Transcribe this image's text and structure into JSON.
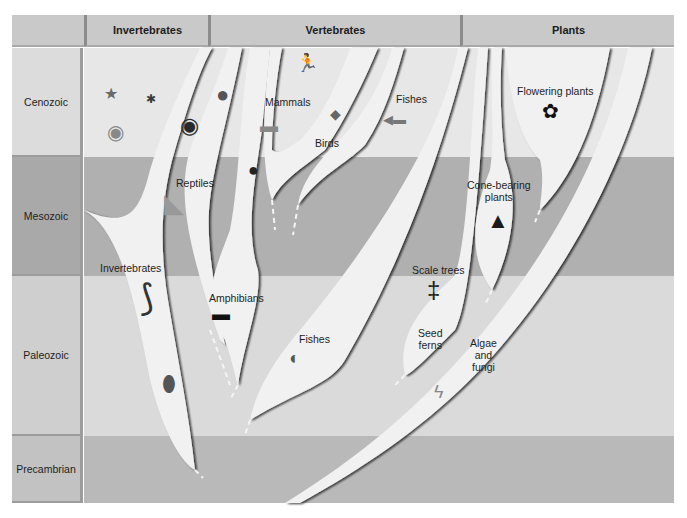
{
  "header": {
    "corner": "",
    "groups": [
      {
        "label": "Invertebrates"
      },
      {
        "label": "Vertebrates"
      },
      {
        "label": "Plants"
      }
    ]
  },
  "eras": [
    {
      "label": "Cenozoic",
      "color": "#e7e7e7",
      "label_color": "#dcdcdc"
    },
    {
      "label": "Mesozoic",
      "color": "#b0b0b0",
      "label_color": "#a9a9a9"
    },
    {
      "label": "Paleozoic",
      "color": "#dadada",
      "label_color": "#cfcfcf"
    },
    {
      "label": "Precambrian",
      "color": "#b9b9b9",
      "label_color": "#c2c2c2"
    }
  ],
  "lineages": {
    "invertebrates": "Invertebrates",
    "reptiles": "Reptiles",
    "amphibians": "Amphibians",
    "mammals": "Mammals",
    "birds": "Birds",
    "fishes_cenozoic": "Fishes",
    "fishes_paleozoic": "Fishes",
    "flowering_plants": "Flowering plants",
    "cone_bearing_1": "Cone-bearing",
    "cone_bearing_2": "plants",
    "scale_trees": "Scale trees",
    "seed_ferns_1": "Seed",
    "seed_ferns_2": "ferns",
    "algae_1": "Algae",
    "algae_2": "and",
    "algae_3": "fungi"
  },
  "icons": {
    "starfish": "★",
    "insect": "✱",
    "frog": "●",
    "snail": "◉",
    "runner": "🏃",
    "big_cat": "▬",
    "birds": "◆",
    "fish": "◀▬",
    "flower": "✿",
    "dinosaur": "◣",
    "rodent": "●",
    "conifer": "▲",
    "crinoid": "⟆",
    "salamander": "▬",
    "trilobite": "⬮",
    "jawless_fish": "◐",
    "scale_tree": "‡",
    "algae": "ϟ"
  },
  "colors": {
    "branch_fill": "#f1f1f1",
    "branch_shadow": "#1a1a1a",
    "header_bg": "#c9c9c9"
  }
}
